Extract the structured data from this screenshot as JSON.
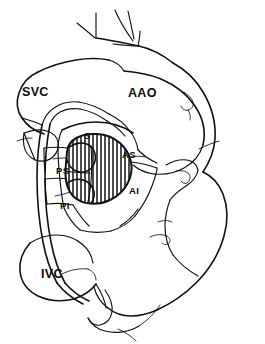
{
  "figure": {
    "background_color": "#ffffff",
    "line_color": "#111111",
    "hatch_color": "#111111"
  },
  "labels": {
    "svc": {
      "text": "SVC",
      "meaning": "superior-vena-cava",
      "size": "major",
      "x": 22,
      "y": 86
    },
    "aao": {
      "text": "AAO",
      "meaning": "ascending-aorta",
      "size": "major",
      "x": 128,
      "y": 87
    },
    "ivc": {
      "text": "IVC",
      "meaning": "inferior-vena-cava",
      "size": "major",
      "x": 41,
      "y": 268
    },
    "s": {
      "text": "S",
      "meaning": "septal-segment",
      "size": "minor",
      "x": 84,
      "y": 131
    },
    "ps": {
      "text": "PS",
      "meaning": "posteroseptal-segment",
      "size": "minor",
      "x": 56,
      "y": 166
    },
    "pi": {
      "text": "PI",
      "meaning": "posteroinferior-segment",
      "size": "minor",
      "x": 60,
      "y": 201
    },
    "as": {
      "text": "AS",
      "meaning": "anterosuperior-segment",
      "size": "minor",
      "x": 122,
      "y": 150
    },
    "ai": {
      "text": "AI",
      "meaning": "anteroinferior-segment",
      "size": "minor",
      "x": 129,
      "y": 186
    }
  }
}
